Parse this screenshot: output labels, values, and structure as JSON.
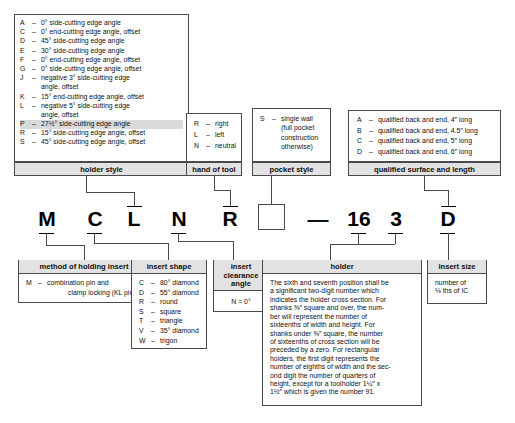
{
  "diagram": {
    "code_positions": [
      {
        "id": "pos1",
        "char": "M"
      },
      {
        "id": "pos2",
        "char": "C"
      },
      {
        "id": "pos3",
        "char": "L"
      },
      {
        "id": "pos4",
        "char": "N"
      },
      {
        "id": "pos5",
        "char": "R"
      },
      {
        "id": "pos6",
        "char": ""
      },
      {
        "id": "separator",
        "char": "—"
      },
      {
        "id": "pos7",
        "char": "16"
      },
      {
        "id": "pos8",
        "char": "3"
      },
      {
        "id": "pos9",
        "char": "D"
      }
    ]
  },
  "holder_style": {
    "caption": "holder style",
    "entries": [
      {
        "key": "A",
        "dash": "–",
        "text": "0° side-cutting edge angle",
        "cont": "",
        "shaded": false
      },
      {
        "key": "C",
        "dash": "–",
        "text": "0° end-cutting edge angle, offset",
        "cont": "",
        "shaded": false
      },
      {
        "key": "D",
        "dash": "–",
        "text": "45° side-cutting edge angle",
        "cont": "",
        "shaded": false
      },
      {
        "key": "E",
        "dash": "–",
        "text": "30° side-cutting edge angle",
        "cont": "",
        "shaded": false
      },
      {
        "key": "F",
        "dash": "–",
        "text": "0° end-cutting edge angle, offset",
        "cont": "",
        "shaded": false
      },
      {
        "key": "G",
        "dash": "–",
        "text": "0° side-cutting edge angle, offset",
        "cont": "",
        "shaded": false
      },
      {
        "key": "J",
        "dash": "–",
        "text": "negative 3° side-cutting edge",
        "cont": "angle, offset",
        "shaded": false
      },
      {
        "key": "K",
        "dash": "–",
        "text": "15° end-cutting edge angle, offset",
        "cont": "",
        "shaded": false
      },
      {
        "key": "L",
        "dash": "–",
        "text": "negative 5° side-cutting edge",
        "cont": "angle, offset",
        "shaded": false
      },
      {
        "key": "P",
        "dash": "–",
        "text": "27½° side-cutting edge angle",
        "cont": "",
        "shaded": true
      },
      {
        "key": "R",
        "dash": "–",
        "text": "15° side-cutting edge angle, offset",
        "cont": "",
        "shaded": false
      },
      {
        "key": "S",
        "dash": "–",
        "text": "45° side-cutting edge angle, offset",
        "cont": "",
        "shaded": false
      }
    ]
  },
  "hand_of_tool": {
    "caption": "hand of tool",
    "entries": [
      {
        "key": "R",
        "dash": "–",
        "text": "right"
      },
      {
        "key": "L",
        "dash": "–",
        "text": "left"
      },
      {
        "key": "N",
        "dash": "–",
        "text": "neutral"
      }
    ]
  },
  "pocket_style": {
    "caption": "pocket style",
    "entries": [
      {
        "key": "S",
        "dash": "–",
        "text": "single wall"
      }
    ],
    "continuation": [
      "(full pocket",
      "construction",
      "otherwise)"
    ]
  },
  "qualified_surface": {
    "caption": "qualified surface and length",
    "entries": [
      {
        "key": "A",
        "dash": "–",
        "text": "qualified back and end, 4″ long"
      },
      {
        "key": "B",
        "dash": "–",
        "text": "qualified back and end, 4.5″ long"
      },
      {
        "key": "C",
        "dash": "–",
        "text": "qualified back and end, 5″ long"
      },
      {
        "key": "D",
        "dash": "–",
        "text": "qualified back and end, 6″ long"
      }
    ]
  },
  "method_of_holding": {
    "caption": "method of holding insert",
    "entries": [
      {
        "key": "M",
        "dash": "–",
        "text": "combination pin and",
        "cont": "clamp locking (KL pin)"
      }
    ]
  },
  "insert_shape": {
    "caption": "insert shape",
    "entries": [
      {
        "key": "C",
        "dash": "–",
        "text": "80° diamond"
      },
      {
        "key": "D",
        "dash": "–",
        "text": "55° diamond"
      },
      {
        "key": "R",
        "dash": "–",
        "text": "round"
      },
      {
        "key": "S",
        "dash": "–",
        "text": "square"
      },
      {
        "key": "T",
        "dash": "–",
        "text": "triangle"
      },
      {
        "key": "V",
        "dash": "–",
        "text": "35° diamond"
      },
      {
        "key": "W",
        "dash": "–",
        "text": "trigon"
      }
    ]
  },
  "insert_clearance_angle": {
    "caption_lines": [
      "insert",
      "clearance",
      "angle"
    ],
    "value": "N = 0°"
  },
  "holder": {
    "caption": "holder",
    "lines": [
      "The sixth and seventh position shall be",
      "a significant two-digit number which",
      "indicates the holder cross section. For",
      "shanks ⅝″ square and over, the num-",
      "ber will represent the number of",
      "sixteenths of width and height. For",
      "shanks under ⅝″ square, the number",
      "of sixteenths of cross section will be",
      "preceded by a zero. For rectangular",
      "holders, the first digit represents the",
      "number of eighths of width and the sec-",
      "ond digit the number of quarters of",
      "height, except for a toolholder 1¼″ x",
      "1½″ which is given the number 91."
    ]
  },
  "insert_size": {
    "caption": "insert size",
    "lines": [
      "number of",
      "⅛ ths of IC"
    ]
  },
  "colors": {
    "border": "#4a4a4a",
    "caption_bg": "#e2e2e2",
    "row_shaded_bg": "#dadada",
    "text": "#111111",
    "page_bg": "#ffffff"
  }
}
